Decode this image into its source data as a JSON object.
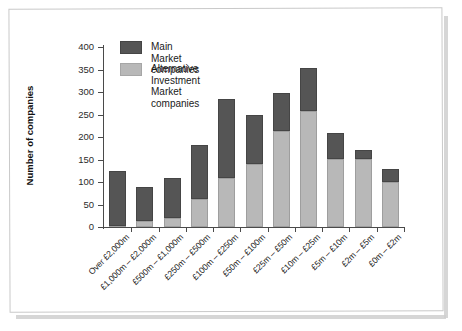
{
  "chart_data": {
    "type": "bar",
    "subtype": "stacked-bar",
    "title": "",
    "xlabel": "",
    "ylabel": "Number of companies",
    "ylim": [
      0,
      400
    ],
    "yticks": [
      0,
      50,
      100,
      150,
      200,
      250,
      300,
      350,
      400
    ],
    "grid": false,
    "legend_position": "top-left",
    "categories": [
      "Over £2,000m",
      "£1,000m – £2,000m",
      "£500m – £1,000m",
      "£250m – £500m",
      "£100m – £250m",
      "£50m – £100m",
      "£25m – £50m",
      "£10m – £25m",
      "£5m – £10m",
      "£2m – £5m",
      "£0m – £2m"
    ],
    "series": [
      {
        "name": "Alternative Investment Market companies",
        "color": "#b8b8b8",
        "values": [
          2,
          13,
          19,
          62,
          109,
          139,
          213,
          258,
          152,
          151,
          100
        ]
      },
      {
        "name": "Main Market companies",
        "color": "#555555",
        "values": [
          122,
          76,
          90,
          120,
          175,
          110,
          85,
          95,
          58,
          20,
          28
        ]
      }
    ],
    "totals": [
      124,
      89,
      109,
      182,
      284,
      249,
      298,
      353,
      210,
      171,
      128
    ]
  },
  "legend": {
    "items": [
      {
        "label": "Main Market companies",
        "color": "#555555",
        "name": "main-market"
      },
      {
        "label": "Alternative Investment\nMarket companies",
        "color": "#b8b8b8",
        "name": "aim"
      }
    ]
  },
  "axes": {
    "y_title": "Number of companies"
  }
}
